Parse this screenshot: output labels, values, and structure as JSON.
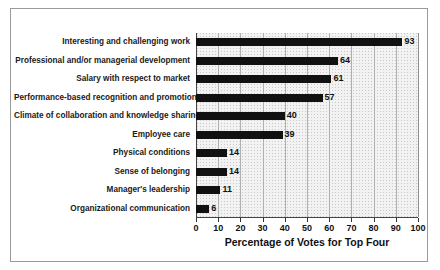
{
  "chart_data": {
    "type": "bar",
    "orientation": "horizontal",
    "title": "",
    "xlabel": "Percentage of Votes for Top Four",
    "ylabel": "",
    "xlim": [
      0,
      100
    ],
    "xticks": [
      0,
      10,
      20,
      30,
      40,
      50,
      60,
      70,
      80,
      90,
      100
    ],
    "grid": true,
    "legend": false,
    "categories": [
      "Interesting and challenging work",
      "Professional and/or managerial development",
      "Salary with respect to market",
      "Performance-based recognition and promotion",
      "Climate of collaboration and knowledge sharing",
      "Employee care",
      "Physical conditions",
      "Sense of belonging",
      "Manager's leadership",
      "Organizational communication"
    ],
    "values": [
      93,
      64,
      61,
      57,
      40,
      39,
      14,
      14,
      11,
      6
    ],
    "data_labels": [
      "93",
      "64",
      "61",
      "57",
      "40",
      "39",
      "14",
      "14",
      "11",
      "6"
    ],
    "bar_color": "#111111",
    "plot_background_color": "#f2f2f2",
    "frame_color": "#9a9a9a"
  }
}
